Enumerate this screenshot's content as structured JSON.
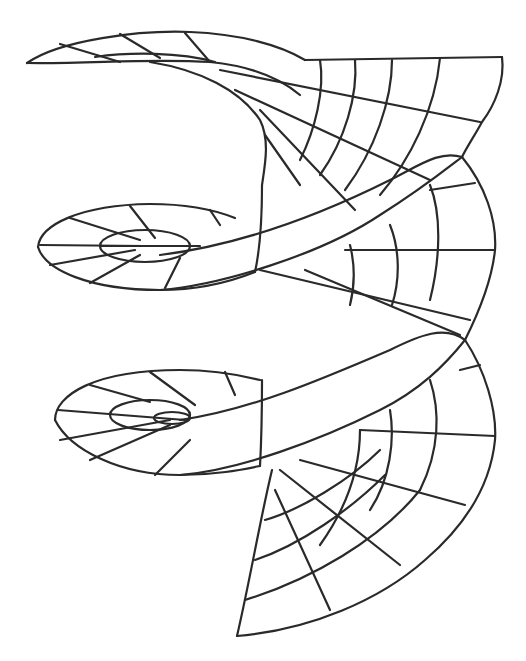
{
  "figure": {
    "title": "",
    "colors": {
      "background": "#ffffff",
      "stroke": "#2a2a2a"
    },
    "turns": 3
  }
}
